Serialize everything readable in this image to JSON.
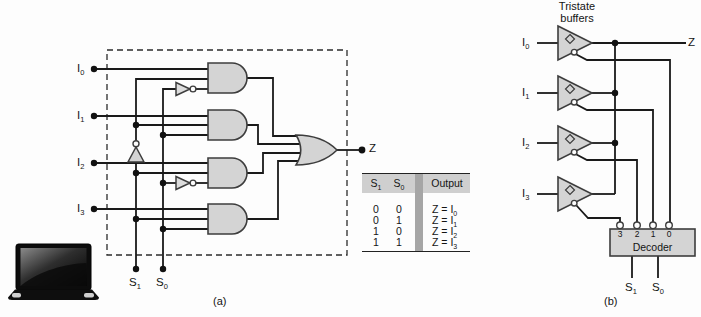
{
  "figure": {
    "caption_a": "(a)",
    "caption_b": "(b)"
  },
  "colors": {
    "gate_fill": "#d4d4d4",
    "gate_stroke": "#3d3d3d",
    "wire": "#1a1a1a",
    "table_header_bg": "#cfcfcf",
    "table_separator": "#a6a6a6",
    "background": "#fdfdfd"
  },
  "circuit_a": {
    "inputs": [
      {
        "base": "I",
        "sub": "0"
      },
      {
        "base": "I",
        "sub": "1"
      },
      {
        "base": "I",
        "sub": "2"
      },
      {
        "base": "I",
        "sub": "3"
      }
    ],
    "selects": [
      {
        "base": "S",
        "sub": "1"
      },
      {
        "base": "S",
        "sub": "0"
      }
    ],
    "output": "Z",
    "truth_table": {
      "col_s1": {
        "base": "S",
        "sub": "1"
      },
      "col_s0": {
        "base": "S",
        "sub": "0"
      },
      "col_output": "Output",
      "rows": [
        {
          "s1": "0",
          "s0": "0",
          "out": {
            "base": "Z = I",
            "sub": "0"
          }
        },
        {
          "s1": "0",
          "s0": "1",
          "out": {
            "base": "Z = I",
            "sub": "1"
          }
        },
        {
          "s1": "1",
          "s0": "0",
          "out": {
            "base": "Z = I",
            "sub": "2"
          }
        },
        {
          "s1": "1",
          "s0": "1",
          "out": {
            "base": "Z = I",
            "sub": "3"
          }
        }
      ]
    }
  },
  "circuit_b": {
    "title": {
      "line1": "Tristate",
      "line2": "buffers"
    },
    "inputs": [
      {
        "base": "I",
        "sub": "0"
      },
      {
        "base": "I",
        "sub": "1"
      },
      {
        "base": "I",
        "sub": "2"
      },
      {
        "base": "I",
        "sub": "3"
      }
    ],
    "output": "Z",
    "decoder": {
      "label": "Decoder",
      "pins": [
        "3",
        "2",
        "1",
        "0"
      ],
      "selects": [
        {
          "base": "S",
          "sub": "1"
        },
        {
          "base": "S",
          "sub": "0"
        }
      ]
    }
  }
}
